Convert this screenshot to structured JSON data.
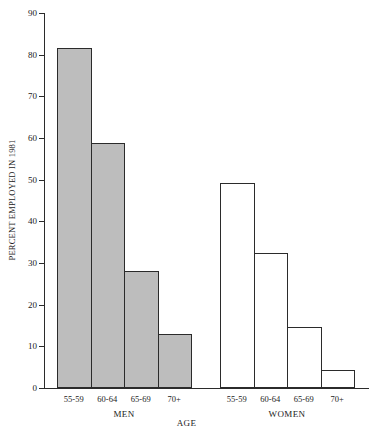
{
  "chart_data": {
    "type": "bar",
    "title": "",
    "xlabel": "AGE",
    "ylabel": "PERCENT EMPLOYED IN 1981",
    "ylim": [
      0,
      90
    ],
    "yticks": [
      0,
      10,
      20,
      30,
      40,
      50,
      60,
      70,
      80,
      90
    ],
    "ytick_labels": [
      "0",
      "10",
      "20",
      "30",
      "40",
      "50",
      "60",
      "70",
      "80",
      "90"
    ],
    "grid": false,
    "legend": "none",
    "categories": [
      "55-59",
      "60-64",
      "65-69",
      "70+"
    ],
    "groups": [
      {
        "name": "MEN",
        "fill": "#bdbdbd"
      },
      {
        "name": "WOMEN",
        "fill": "#ffffff"
      }
    ],
    "series": [
      {
        "name": "MEN",
        "values": [
          81.5,
          58.8,
          28.0,
          13.0
        ]
      },
      {
        "name": "WOMEN",
        "values": [
          49.3,
          32.3,
          14.7,
          4.4
        ]
      }
    ],
    "bars": [
      {
        "group": "MEN",
        "category": "55-59",
        "value": 81.5,
        "fill": "#bdbdbd"
      },
      {
        "group": "MEN",
        "category": "60-64",
        "value": 58.8,
        "fill": "#bdbdbd"
      },
      {
        "group": "MEN",
        "category": "65-69",
        "value": 28.0,
        "fill": "#bdbdbd"
      },
      {
        "group": "MEN",
        "category": "70+",
        "value": 13.0,
        "fill": "#bdbdbd"
      },
      {
        "group": "WOMEN",
        "category": "55-59",
        "value": 49.3,
        "fill": "#ffffff"
      },
      {
        "group": "WOMEN",
        "category": "60-64",
        "value": 32.3,
        "fill": "#ffffff"
      },
      {
        "group": "WOMEN",
        "category": "65-69",
        "value": 14.7,
        "fill": "#ffffff"
      },
      {
        "group": "WOMEN",
        "category": "70+",
        "value": 4.4,
        "fill": "#ffffff"
      }
    ],
    "colors": {
      "axis": "#2b2b2b",
      "men_fill": "#bdbdbd",
      "women_fill": "#ffffff",
      "bar_border": "#2b2b2b",
      "background": "#ffffff"
    }
  }
}
